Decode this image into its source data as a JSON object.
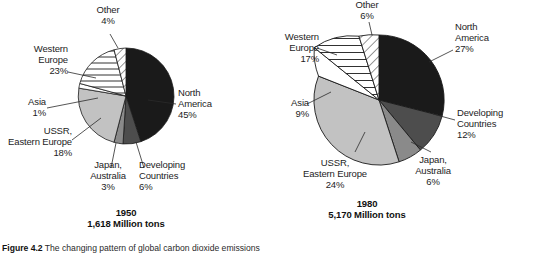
{
  "figure": {
    "caption_label": "Figure 4.2",
    "caption_text": "The changing pattern of global carbon dioxide emissions"
  },
  "charts": [
    {
      "id": "pie-1950",
      "year": "1950",
      "total": "1,618 Million tons",
      "slices": [
        {
          "key": "north-america",
          "label": "North\nAmerica",
          "value_label": "45%",
          "value": 45,
          "fill": "black"
        },
        {
          "key": "developing-countries",
          "label": "Developing\nCountries",
          "value_label": "6%",
          "value": 6,
          "fill": "dark-gray"
        },
        {
          "key": "japan-australia",
          "label": "Japan,\nAustralia",
          "value_label": "3%",
          "value": 3,
          "fill": "mid-gray"
        },
        {
          "key": "ussr-eastern-europe",
          "label": "USSR,\nEastern Europe",
          "value_label": "18%",
          "value": 18,
          "fill": "light-gray"
        },
        {
          "key": "asia",
          "label": "Asia",
          "value_label": "1%",
          "value": 1,
          "fill": "white"
        },
        {
          "key": "western-europe",
          "label": "Western\nEurope",
          "value_label": "23%",
          "value": 23,
          "fill": "horizontal-hatch"
        },
        {
          "key": "other",
          "label": "Other",
          "value_label": "4%",
          "value": 4,
          "fill": "diagonal-hatch"
        }
      ]
    },
    {
      "id": "pie-1980",
      "year": "1980",
      "total": "5,170 Million tons",
      "slices": [
        {
          "key": "north-america",
          "label": "North\nAmerica",
          "value_label": "27%",
          "value": 27,
          "fill": "black"
        },
        {
          "key": "developing-countries",
          "label": "Developing\nCountries",
          "value_label": "12%",
          "value": 12,
          "fill": "dark-gray"
        },
        {
          "key": "japan-australia",
          "label": "Japan,\nAustralia",
          "value_label": "6%",
          "value": 6,
          "fill": "mid-gray"
        },
        {
          "key": "ussr-eastern-europe",
          "label": "USSR,\nEastern Europe",
          "value_label": "24%",
          "value": 24,
          "fill": "light-gray"
        },
        {
          "key": "asia",
          "label": "Asia",
          "value_label": "9%",
          "value": 9,
          "fill": "white"
        },
        {
          "key": "western-europe",
          "label": "Western\nEurope",
          "value_label": "17%",
          "value": 17,
          "fill": "horizontal-hatch"
        },
        {
          "key": "other",
          "label": "Other",
          "value_label": "6%",
          "value": 6,
          "fill": "diagonal-hatch"
        }
      ]
    }
  ],
  "colors": {
    "black": "#1a1a1a",
    "dark_gray": "#4d4d4d",
    "mid_gray": "#8a8a8a",
    "light_gray": "#c2c2c2",
    "white": "#ffffff",
    "stroke": "#1a1a1a"
  },
  "chart_data": [
    {
      "type": "pie",
      "title": "1950",
      "subtitle": "1,618 Million tons",
      "categories": [
        "North America",
        "Developing Countries",
        "Japan, Australia",
        "USSR, Eastern Europe",
        "Asia",
        "Western Europe",
        "Other"
      ],
      "values": [
        45,
        6,
        3,
        18,
        1,
        23,
        4
      ],
      "unit": "percent of global carbon dioxide emissions",
      "total_emissions": "1,618 Million tons",
      "legend": "labels-on-slices",
      "grid": false
    },
    {
      "type": "pie",
      "title": "1980",
      "subtitle": "5,170 Million tons",
      "categories": [
        "North America",
        "Developing Countries",
        "Japan, Australia",
        "USSR, Eastern Europe",
        "Asia",
        "Western Europe",
        "Other"
      ],
      "values": [
        27,
        12,
        6,
        24,
        9,
        17,
        6
      ],
      "unit": "percent of global carbon dioxide emissions",
      "total_emissions": "5,170 Million tons",
      "legend": "labels-on-slices",
      "grid": false
    }
  ]
}
